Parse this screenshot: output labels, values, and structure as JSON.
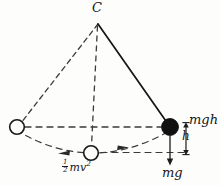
{
  "figure": {
    "type": "physics-diagram",
    "background_color": "#fdfdfc",
    "ink_color": "#151515"
  },
  "labels": {
    "pivot": "C",
    "potential_energy": "mgh",
    "height": "h",
    "weight_force": "mg",
    "kinetic_energy_numerator": "1",
    "kinetic_energy_denominator": "2",
    "kinetic_energy_body": "mv",
    "kinetic_energy_exponent": "2"
  },
  "elements": {
    "pivot_point": {
      "x": 98,
      "y": 22,
      "label": "C"
    },
    "string_left": {
      "from": [
        98,
        22
      ],
      "to": [
        17,
        127
      ],
      "style": "dashed"
    },
    "string_center": {
      "from": [
        98,
        22
      ],
      "to": [
        91,
        147
      ],
      "style": "dashed"
    },
    "string_right": {
      "from": [
        98,
        22
      ],
      "to": [
        170,
        127
      ],
      "style": "solid"
    },
    "bob_left": {
      "x": 17,
      "y": 127,
      "r": 7.5,
      "fill": "hollow"
    },
    "bob_bottom": {
      "x": 91,
      "y": 153,
      "r": 7.5,
      "fill": "hollow"
    },
    "bob_right": {
      "x": 170,
      "y": 127,
      "r": 8.5,
      "fill": "solid"
    },
    "chord_dashed": {
      "from": [
        25,
        127
      ],
      "to": [
        162,
        127
      ],
      "style": "dashed"
    },
    "baseline_dashed": {
      "from": [
        100,
        153
      ],
      "to": [
        186,
        153
      ],
      "style": "dashed"
    },
    "swing_arc": {
      "from": [
        17,
        131
      ],
      "to": [
        170,
        131
      ],
      "apex_y": 155,
      "style": "dashed"
    },
    "height_arrow": {
      "x": 186,
      "from_y": 127,
      "to_y": 153,
      "style": "double-headed"
    },
    "weight_arrow": {
      "x": 170,
      "from_y": 136,
      "to_y": 164,
      "style": "single-headed-down"
    },
    "motion_arrowheads": [
      {
        "x": 63,
        "y": 152,
        "direction": "left"
      },
      {
        "x": 122,
        "y": 147,
        "direction": "right"
      }
    ]
  }
}
